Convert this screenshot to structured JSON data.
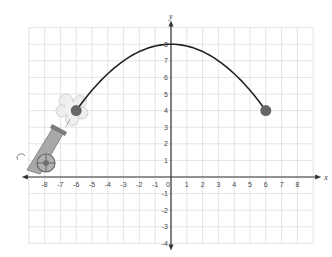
{
  "chart_data": {
    "type": "line",
    "title": "",
    "xlabel": "x",
    "ylabel": "y",
    "xlim": [
      -9,
      9
    ],
    "ylim": [
      -4,
      9
    ],
    "grid": true,
    "x_ticks": [
      -8,
      -7,
      -6,
      -5,
      -4,
      -3,
      -2,
      -1,
      0,
      1,
      2,
      3,
      4,
      5,
      6,
      7,
      8
    ],
    "y_ticks": [
      -4,
      -3,
      -2,
      -1,
      1,
      2,
      3,
      4,
      5,
      6,
      7,
      8
    ],
    "series": [
      {
        "name": "cannonball trajectory",
        "equation": "y = -(1/9)x^2 + 8",
        "x": [
          -6,
          -5,
          -4,
          -3,
          -2,
          -1,
          0,
          1,
          2,
          3,
          4,
          5,
          6
        ],
        "y": [
          4,
          5.22,
          6.22,
          7,
          7.56,
          7.89,
          8,
          7.89,
          7.56,
          7,
          6.22,
          5.22,
          4
        ],
        "color": "#222222"
      }
    ],
    "points": [
      {
        "name": "launch point",
        "x": -6,
        "y": 4,
        "color": "#666666"
      },
      {
        "name": "landing point",
        "x": 6,
        "y": 4,
        "color": "#666666"
      },
      {
        "name": "vertex",
        "x": 0,
        "y": 8
      }
    ],
    "annotations": [
      "cannon illustration firing from left side with smoke puff at (-6, 4)"
    ]
  },
  "labels": {
    "x_axis": "x",
    "y_axis": "y",
    "origin": "0"
  },
  "colors": {
    "grid": "#d8d8d8",
    "axis": "#333333",
    "curve": "#222222",
    "ball": "#6a6a6a",
    "cannon": "#9a9a9a"
  }
}
